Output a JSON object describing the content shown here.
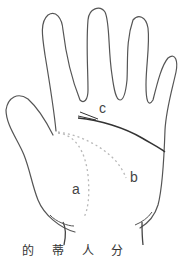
{
  "diagram": {
    "labels": {
      "a": "a",
      "b": "b",
      "c": "c"
    },
    "caption": "的 蒂 人 分",
    "colors": {
      "outline": "#555555",
      "solid_line": "#333333",
      "dotted_line": "#b8b8b8",
      "background": "#ffffff"
    }
  }
}
